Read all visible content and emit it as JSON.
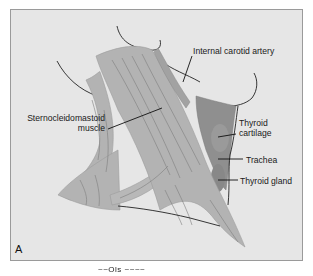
{
  "figure": {
    "panel_label": "A",
    "caption_fragment": "~~Ols ~~~~",
    "colors": {
      "background": "#e6e6e6",
      "frame_border": "#9a9a9a",
      "muscle_fill": "#b3b3b3",
      "muscle_edge": "#9c9c9c",
      "fiber_line": "#7d7d7d",
      "thyroid_fill": "#8f8f8f",
      "outline": "#222222",
      "leader_line": "#111111"
    }
  },
  "labels": {
    "internal_carotid_artery": "Internal carotid artery",
    "sternocleidomastoid_line1": "Sternocleidomastoid",
    "sternocleidomastoid_line2": "muscle",
    "thyroid_cartilage_line1": "Thyroid",
    "thyroid_cartilage_line2": "cartilage",
    "trachea": "Trachea",
    "thyroid_gland": "Thyroid gland"
  }
}
